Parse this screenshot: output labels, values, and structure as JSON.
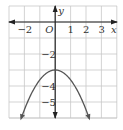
{
  "chart_data": {
    "type": "line",
    "title": "",
    "xlabel": "x",
    "ylabel": "y",
    "origin_label": "O",
    "xlim": [
      -3,
      4
    ],
    "ylim": [
      -6,
      1
    ],
    "grid": true,
    "x_ticks": [
      {
        "value": -2,
        "label": "−2"
      },
      {
        "value": 1,
        "label": "1"
      },
      {
        "value": 2,
        "label": "2"
      },
      {
        "value": 3,
        "label": "3"
      }
    ],
    "y_ticks": [
      {
        "value": -2,
        "label": "−2"
      },
      {
        "value": -4,
        "label": "−4"
      },
      {
        "value": -5,
        "label": "−5"
      }
    ],
    "series": [
      {
        "name": "parabola",
        "description": "Downward-opening parabola with vertex at (0, -3), arrows at both ends",
        "x": [
          -2.2,
          -2,
          -1.5,
          -1,
          -0.5,
          0,
          0.5,
          1,
          1.5,
          2,
          2.2
        ],
        "y": [
          -6.0,
          -5.7,
          -4.6,
          -3.75,
          -3.2,
          -3,
          -3.2,
          -3.75,
          -4.6,
          -5.7,
          -6.0
        ]
      }
    ],
    "colors": {
      "grid": "#c8c8c8",
      "axis": "#222222",
      "curve": "#555555"
    }
  }
}
